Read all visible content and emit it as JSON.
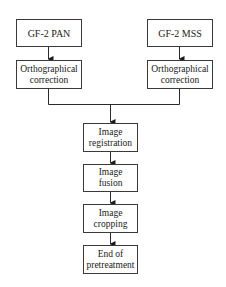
{
  "diagram": {
    "type": "flowchart",
    "nodes": {
      "pan": {
        "label": "GF-2 PAN"
      },
      "mss": {
        "label": "GF-2 MSS"
      },
      "ortho_pan": {
        "label": "Orthographical\ncorrection"
      },
      "ortho_mss": {
        "label": "Orthographical\ncorrection"
      },
      "registration": {
        "label": "Image\nregistration"
      },
      "fusion": {
        "label": "Image\nfusion"
      },
      "cropping": {
        "label": "Image\ncropping"
      },
      "end": {
        "label": "End of\npretreatment"
      }
    },
    "edges": [
      [
        "pan",
        "ortho_pan"
      ],
      [
        "mss",
        "ortho_mss"
      ],
      [
        "ortho_pan",
        "registration"
      ],
      [
        "ortho_mss",
        "registration"
      ],
      [
        "registration",
        "fusion"
      ],
      [
        "fusion",
        "cropping"
      ],
      [
        "cropping",
        "end"
      ]
    ]
  }
}
